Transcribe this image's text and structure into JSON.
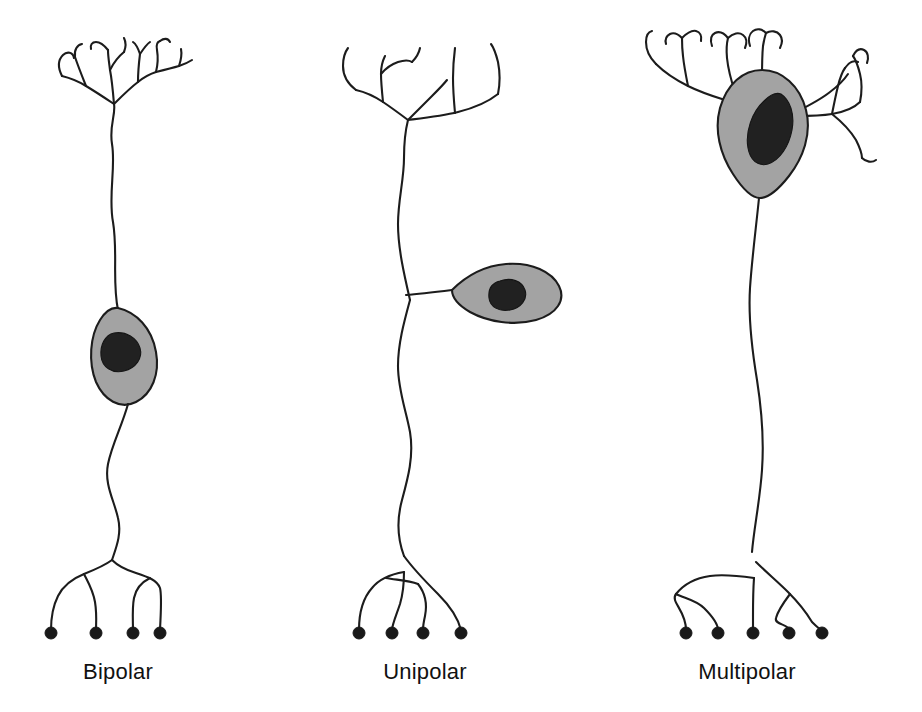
{
  "figure": {
    "background_color": "#ffffff",
    "width": 922,
    "height": 712
  },
  "style": {
    "stroke_color": "#1c1c1c",
    "soma_fill": "#a3a3a3",
    "nucleus_fill": "#212121",
    "terminal_fill": "#191919",
    "label_color": "#111111",
    "stroke_width": 2.1
  },
  "panels": [
    {
      "id": "bipolar",
      "label": "Bipolar",
      "label_x": 118,
      "label_y": 679,
      "soma_shape": "elongated-oval",
      "dendrite_count": 1,
      "terminal_count": 4,
      "terminals": [
        {
          "cx": 51,
          "cy": 633
        },
        {
          "cx": 96,
          "cy": 633
        },
        {
          "cx": 133,
          "cy": 633
        },
        {
          "cx": 160,
          "cy": 633
        }
      ]
    },
    {
      "id": "unipolar",
      "label": "Unipolar",
      "label_x": 425,
      "label_y": 679,
      "soma_shape": "teardrop-lateral",
      "dendrite_count": 1,
      "terminal_count": 4,
      "terminals": [
        {
          "cx": 359,
          "cy": 633
        },
        {
          "cx": 392,
          "cy": 633
        },
        {
          "cx": 423,
          "cy": 633
        },
        {
          "cx": 461,
          "cy": 633
        }
      ]
    },
    {
      "id": "multipolar",
      "label": "Multipolar",
      "label_x": 747,
      "label_y": 679,
      "soma_shape": "pyramidal",
      "dendrite_count": 4,
      "terminal_count": 5,
      "terminals": [
        {
          "cx": 686,
          "cy": 633
        },
        {
          "cx": 718,
          "cy": 633
        },
        {
          "cx": 753,
          "cy": 633
        },
        {
          "cx": 789,
          "cy": 633
        },
        {
          "cx": 822,
          "cy": 633
        }
      ]
    }
  ]
}
